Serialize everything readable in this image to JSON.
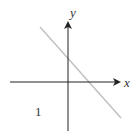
{
  "diagram": {
    "type": "coordinate-plane-line",
    "axes": {
      "x_label": "x",
      "y_label": "y",
      "axis_color": "#222222"
    },
    "line": {
      "color": "#b8b8b8",
      "slope": "negative",
      "description": "line with negative slope, positive y-intercept and positive x-intercept"
    },
    "annotations": [
      {
        "text": "1",
        "position": "lower-left quadrant"
      }
    ]
  }
}
